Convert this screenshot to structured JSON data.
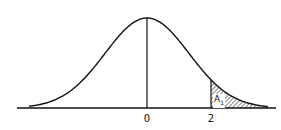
{
  "chart_data": {
    "type": "area",
    "title": "",
    "xlabel": "",
    "ylabel": "",
    "tick_labels": [
      "0",
      "2"
    ],
    "ticks": [
      0,
      2
    ],
    "mean": 0,
    "shaded_region": {
      "from": 2,
      "to": "infinity",
      "label": "A",
      "label_subscript": "1",
      "pattern": "diagonal-hatch"
    },
    "vertical_lines": [
      0,
      2
    ],
    "grid": false,
    "legend": null
  },
  "labels": {
    "tick_zero": "0",
    "tick_two": "2",
    "area_main": "A",
    "area_sub": "1"
  },
  "colors": {
    "line": "#111111",
    "background": "#ffffff"
  }
}
